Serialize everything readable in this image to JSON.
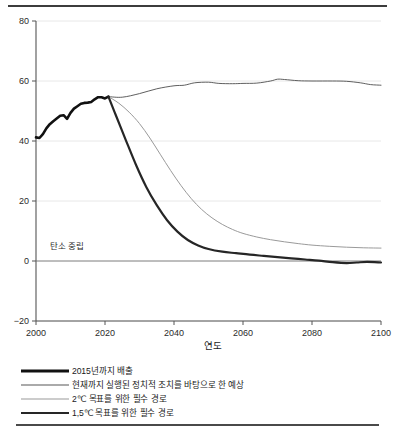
{
  "chart_data": {
    "type": "line",
    "title": "",
    "xlabel": "연도",
    "ylabel": "",
    "xlim": [
      2000,
      2100
    ],
    "ylim": [
      -20,
      80
    ],
    "xticks": [
      "2000",
      "2020",
      "2040",
      "2060",
      "2080",
      "2100"
    ],
    "yticks": [
      "80",
      "60",
      "40",
      "20",
      "0",
      "-20"
    ],
    "grid": "horizontal",
    "legend_position": "below",
    "annotations": [
      {
        "text": "탄소 중립",
        "x": 2004,
        "y": 4
      }
    ],
    "series": [
      {
        "name": "2015년까지 배출",
        "color": "#111111",
        "width": 2.6,
        "points": [
          [
            2000,
            41.2
          ],
          [
            2001,
            41.0
          ],
          [
            2002,
            42.3
          ],
          [
            2003,
            44.2
          ],
          [
            2004,
            45.6
          ],
          [
            2005,
            46.6
          ],
          [
            2006,
            47.5
          ],
          [
            2007,
            48.4
          ],
          [
            2008,
            48.6
          ],
          [
            2009,
            47.4
          ],
          [
            2010,
            49.4
          ],
          [
            2011,
            50.8
          ],
          [
            2012,
            51.6
          ],
          [
            2013,
            52.4
          ],
          [
            2014,
            52.7
          ],
          [
            2015,
            52.8
          ],
          [
            2016,
            53.0
          ],
          [
            2017,
            53.9
          ],
          [
            2018,
            54.6
          ],
          [
            2019,
            54.6
          ],
          [
            2020,
            54.2
          ],
          [
            2021,
            54.8
          ]
        ]
      },
      {
        "name": "현재까지 실행된 정치적 조치를 바탕으로 한 예상",
        "color": "#4d4d4d",
        "width": 0.9,
        "points": [
          [
            2021,
            54.8
          ],
          [
            2025,
            54.6
          ],
          [
            2030,
            55.8
          ],
          [
            2035,
            57.4
          ],
          [
            2040,
            58.4
          ],
          [
            2043,
            58.6
          ],
          [
            2046,
            59.4
          ],
          [
            2050,
            59.6
          ],
          [
            2053,
            59.2
          ],
          [
            2057,
            59.1
          ],
          [
            2060,
            59.2
          ],
          [
            2064,
            59.3
          ],
          [
            2068,
            60.0
          ],
          [
            2070,
            60.6
          ],
          [
            2072,
            60.5
          ],
          [
            2076,
            60.1
          ],
          [
            2080,
            60.0
          ],
          [
            2086,
            60.0
          ],
          [
            2090,
            59.9
          ],
          [
            2094,
            59.4
          ],
          [
            2097,
            58.8
          ],
          [
            2100,
            58.6
          ]
        ]
      },
      {
        "name": "2℃ 목표를 위한 필수 경로",
        "color": "#9a9a9a",
        "width": 1.0,
        "points": [
          [
            2021,
            54.8
          ],
          [
            2024,
            52.6
          ],
          [
            2027,
            49.6
          ],
          [
            2030,
            45.8
          ],
          [
            2033,
            41.0
          ],
          [
            2036,
            35.6
          ],
          [
            2039,
            30.2
          ],
          [
            2042,
            25.2
          ],
          [
            2045,
            20.8
          ],
          [
            2048,
            17.2
          ],
          [
            2051,
            14.4
          ],
          [
            2054,
            12.2
          ],
          [
            2057,
            10.5
          ],
          [
            2060,
            9.2
          ],
          [
            2064,
            8.0
          ],
          [
            2068,
            7.1
          ],
          [
            2072,
            6.4
          ],
          [
            2076,
            5.8
          ],
          [
            2080,
            5.3
          ],
          [
            2085,
            4.9
          ],
          [
            2090,
            4.6
          ],
          [
            2095,
            4.4
          ],
          [
            2100,
            4.3
          ]
        ]
      },
      {
        "name": "1,5℃ 목표를 위한 필수 경로",
        "color": "#262626",
        "width": 2.2,
        "points": [
          [
            2021,
            54.8
          ],
          [
            2023,
            49.0
          ],
          [
            2026,
            40.4
          ],
          [
            2029,
            32.0
          ],
          [
            2032,
            24.6
          ],
          [
            2035,
            18.6
          ],
          [
            2038,
            13.6
          ],
          [
            2041,
            9.8
          ],
          [
            2044,
            7.0
          ],
          [
            2047,
            5.2
          ],
          [
            2050,
            4.0
          ],
          [
            2054,
            3.1
          ],
          [
            2058,
            2.6
          ],
          [
            2062,
            2.1
          ],
          [
            2066,
            1.7
          ],
          [
            2070,
            1.3
          ],
          [
            2074,
            0.9
          ],
          [
            2078,
            0.5
          ],
          [
            2082,
            0.1
          ],
          [
            2086,
            -0.4
          ],
          [
            2090,
            -0.7
          ],
          [
            2093,
            -0.5
          ],
          [
            2096,
            -0.3
          ],
          [
            2100,
            -0.5
          ]
        ]
      }
    ]
  },
  "legend": {
    "items": [
      {
        "label": "2015년까지 배출",
        "color": "#111111",
        "thickness": "3px"
      },
      {
        "label": "현재까지 실행된 정치적 조치를 바탕으로 한 예상",
        "color": "#565656",
        "thickness": "1px"
      },
      {
        "label": "2℃ 목표를 위한 필수 경로",
        "color": "#9a9a9a",
        "thickness": "1px"
      },
      {
        "label": "1,5℃ 목표를 위한 필수 경로",
        "color": "#262626",
        "thickness": "2px"
      }
    ]
  }
}
